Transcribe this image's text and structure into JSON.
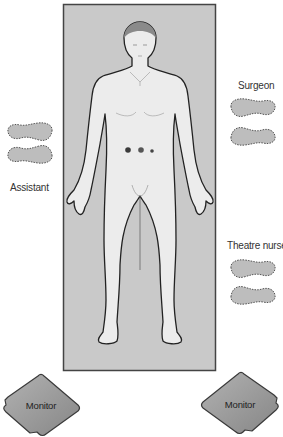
{
  "diagram": {
    "type": "operating-theatre-layout",
    "operating_table": {
      "color": "#c9c9c9",
      "border": "#444444"
    },
    "patient": {
      "position": "supine",
      "port_sites": 3
    },
    "roles": [
      {
        "id": "surgeon",
        "label": "Surgeon",
        "side": "right-upper"
      },
      {
        "id": "assistant",
        "label": "Assistant",
        "side": "left"
      },
      {
        "id": "theatre_nurse",
        "label": "Theatre nurse",
        "side": "right-lower"
      }
    ],
    "monitors": [
      {
        "id": "monitor_left",
        "label": "Monitor"
      },
      {
        "id": "monitor_right",
        "label": "Monitor"
      }
    ],
    "colors": {
      "footprint_fill": "#bdbdbd",
      "footprint_stroke": "#555555",
      "monitor_fill": "#9a9a9a",
      "monitor_stroke": "#3a3a3a",
      "body_fill": "#ececec",
      "body_stroke": "#222222"
    }
  }
}
